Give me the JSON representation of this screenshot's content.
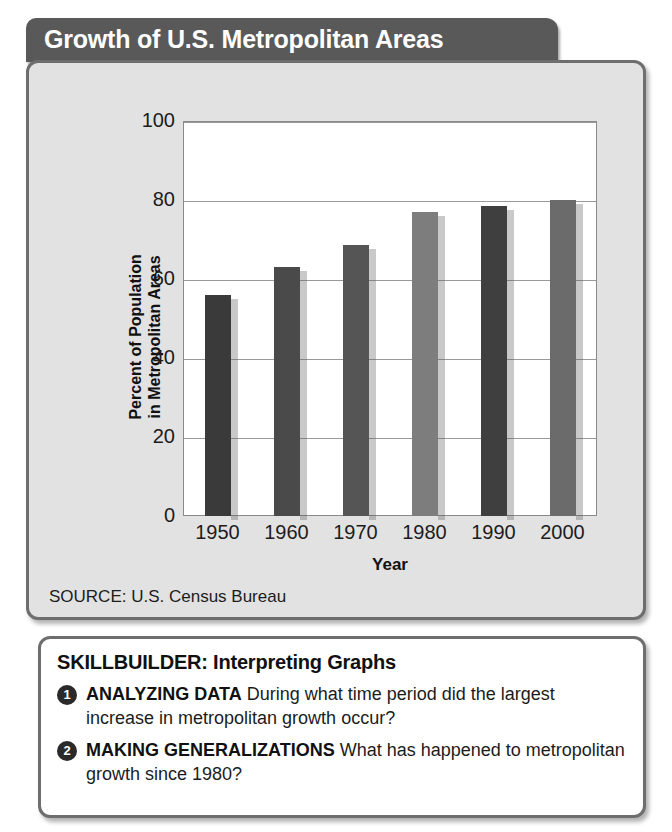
{
  "title": "Growth of U.S. Metropolitan Areas",
  "source": "SOURCE: U.S. Census Bureau",
  "chart_data": {
    "type": "bar",
    "title": "Growth of U.S. Metropolitan Areas",
    "xlabel": "Year",
    "ylabel": "Percent of Population in Metropolitan Areas",
    "ylabel_line1": "Percent of Population",
    "ylabel_line2": "in Metropolitan Areas",
    "categories": [
      "1950",
      "1960",
      "1970",
      "1980",
      "1990",
      "2000"
    ],
    "values": [
      56,
      63,
      68.5,
      77,
      78.5,
      80
    ],
    "ylim": [
      0,
      100
    ],
    "yticks": [
      0,
      20,
      40,
      60,
      80,
      100
    ],
    "grid": true,
    "legend": "none",
    "bar_colors": [
      "#3a3a3a",
      "#4a4a4a",
      "#555555",
      "#7d7d7d",
      "#3f3f3f",
      "#6b6b6b"
    ],
    "source": "SOURCE: U.S. Census Bureau"
  },
  "skillbuilder": {
    "heading": "SKILLBUILDER: Interpreting Graphs",
    "items": [
      {
        "number": "1",
        "label": "ANALYZING DATA",
        "text": " During what time period did the largest increase in metropolitan growth occur?"
      },
      {
        "number": "2",
        "label": "MAKING GENERALIZATIONS",
        "text": " What has happened to metropolitan growth since 1980?"
      }
    ]
  }
}
